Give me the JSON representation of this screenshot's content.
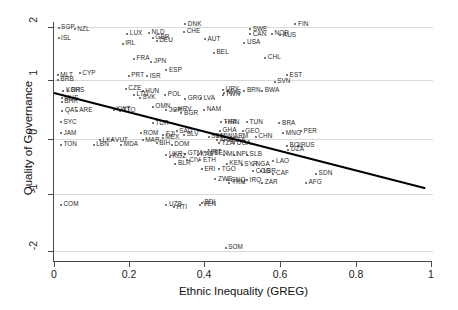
{
  "chart_data": {
    "type": "scatter",
    "title": "",
    "xlabel": "Ethnic Inequality (GREG)",
    "ylabel": "Quality of Governance",
    "xlim": [
      0,
      1
    ],
    "ylim": [
      -2.2,
      2.2
    ],
    "xticks": [
      0,
      0.2,
      0.4,
      0.6,
      0.8,
      1
    ],
    "xticklabels": [
      "0",
      "0.2",
      "0.4",
      "0.6",
      "0.8",
      "1"
    ],
    "yticks": [
      2,
      1,
      0,
      -1,
      -2
    ],
    "yticklabels": [
      "2",
      "1",
      "0",
      "-1",
      "-2"
    ],
    "grid": "horizontal",
    "legend": "none",
    "point_color": "#4d4d4d",
    "label_color": "#2b2b2b",
    "grid_color": "#d9d9d9",
    "axis_color": "#4a4a4a",
    "fit_line": {
      "type": "linear-fit",
      "color": "#000000",
      "width": 2.0,
      "x_start": 0.0,
      "y_start": 0.82,
      "x_end": 0.985,
      "y_end": -0.88,
      "slope": -1.73,
      "intercept": 0.82
    },
    "points": [
      {
        "label": "SGP",
        "x": 0.012,
        "y": 1.99
      },
      {
        "label": "NZL",
        "x": 0.055,
        "y": 1.96
      },
      {
        "label": "DNK",
        "x": 0.348,
        "y": 2.05
      },
      {
        "label": "FIN",
        "x": 0.64,
        "y": 2.05
      },
      {
        "label": "SWE",
        "x": 0.52,
        "y": 1.96
      },
      {
        "label": "ISL",
        "x": 0.012,
        "y": 1.8
      },
      {
        "label": "LUX",
        "x": 0.194,
        "y": 1.88
      },
      {
        "label": "NLD",
        "x": 0.252,
        "y": 1.9
      },
      {
        "label": "CHE",
        "x": 0.345,
        "y": 1.91
      },
      {
        "label": "CAN",
        "x": 0.52,
        "y": 1.87
      },
      {
        "label": "NOR",
        "x": 0.578,
        "y": 1.88
      },
      {
        "label": "AUS",
        "x": 0.6,
        "y": 1.85
      },
      {
        "label": "GBR",
        "x": 0.262,
        "y": 1.81
      },
      {
        "label": "DEU",
        "x": 0.272,
        "y": 1.75
      },
      {
        "label": "AUT",
        "x": 0.4,
        "y": 1.78
      },
      {
        "label": "IRL",
        "x": 0.182,
        "y": 1.7
      },
      {
        "label": "USA",
        "x": 0.505,
        "y": 1.72
      },
      {
        "label": "BEL",
        "x": 0.424,
        "y": 1.54
      },
      {
        "label": "FRA",
        "x": 0.212,
        "y": 1.43
      },
      {
        "label": "JPN",
        "x": 0.258,
        "y": 1.38
      },
      {
        "label": "CHL",
        "x": 0.56,
        "y": 1.45
      },
      {
        "label": "ESP",
        "x": 0.298,
        "y": 1.23
      },
      {
        "label": "MLT",
        "x": 0.01,
        "y": 1.14
      },
      {
        "label": "CYP",
        "x": 0.068,
        "y": 1.17
      },
      {
        "label": "PRT",
        "x": 0.198,
        "y": 1.13
      },
      {
        "label": "ISR",
        "x": 0.247,
        "y": 1.12
      },
      {
        "label": "EST",
        "x": 0.618,
        "y": 1.14
      },
      {
        "label": "BRB",
        "x": 0.01,
        "y": 1.06
      },
      {
        "label": "SVN",
        "x": 0.585,
        "y": 1.02
      },
      {
        "label": "CZE",
        "x": 0.19,
        "y": 0.9
      },
      {
        "label": "HUN",
        "x": 0.235,
        "y": 0.85
      },
      {
        "label": "POL",
        "x": 0.295,
        "y": 0.79
      },
      {
        "label": "KOR",
        "x": 0.025,
        "y": 0.86
      },
      {
        "label": "BHS",
        "x": 0.038,
        "y": 0.86
      },
      {
        "label": "LTU",
        "x": 0.212,
        "y": 0.79
      },
      {
        "label": "SVK",
        "x": 0.228,
        "y": 0.74
      },
      {
        "label": "URY",
        "x": 0.448,
        "y": 0.88
      },
      {
        "label": "MYS",
        "x": 0.452,
        "y": 0.82
      },
      {
        "label": "TWN",
        "x": 0.448,
        "y": 0.79
      },
      {
        "label": "BRN",
        "x": 0.505,
        "y": 0.86
      },
      {
        "label": "BWA",
        "x": 0.552,
        "y": 0.86
      },
      {
        "label": "MUS",
        "x": 0.02,
        "y": 0.73
      },
      {
        "label": "BHR",
        "x": 0.02,
        "y": 0.66
      },
      {
        "label": "LVA",
        "x": 0.39,
        "y": 0.73
      },
      {
        "label": "GRC",
        "x": 0.348,
        "y": 0.72
      },
      {
        "label": "OMN",
        "x": 0.262,
        "y": 0.58
      },
      {
        "label": "KWT",
        "x": 0.158,
        "y": 0.52
      },
      {
        "label": "QAT",
        "x": 0.022,
        "y": 0.5
      },
      {
        "label": "ARE",
        "x": 0.06,
        "y": 0.5
      },
      {
        "label": "TTO",
        "x": 0.175,
        "y": 0.5
      },
      {
        "label": "BGR",
        "x": 0.338,
        "y": 0.46
      },
      {
        "label": "HRV",
        "x": 0.322,
        "y": 0.52
      },
      {
        "label": "JOR",
        "x": 0.298,
        "y": 0.51
      },
      {
        "label": "NAM",
        "x": 0.398,
        "y": 0.52
      },
      {
        "label": "SYC",
        "x": 0.018,
        "y": 0.3
      },
      {
        "label": "TUR",
        "x": 0.262,
        "y": 0.28
      },
      {
        "label": "THA",
        "x": 0.443,
        "y": 0.3
      },
      {
        "label": "IRN",
        "x": 0.455,
        "y": 0.3
      },
      {
        "label": "TUN",
        "x": 0.512,
        "y": 0.3
      },
      {
        "label": "BRA",
        "x": 0.598,
        "y": 0.28
      },
      {
        "label": "JAM",
        "x": 0.018,
        "y": 0.1
      },
      {
        "label": "ROM",
        "x": 0.23,
        "y": 0.1
      },
      {
        "label": "SAU",
        "x": 0.325,
        "y": 0.14
      },
      {
        "label": "GHA",
        "x": 0.44,
        "y": 0.15
      },
      {
        "label": "GEO",
        "x": 0.5,
        "y": 0.14
      },
      {
        "label": "CHN",
        "x": 0.535,
        "y": 0.04
      },
      {
        "label": "MNG",
        "x": 0.608,
        "y": 0.1
      },
      {
        "label": "PER",
        "x": 0.655,
        "y": 0.14
      },
      {
        "label": "MEX",
        "x": 0.288,
        "y": 0.02
      },
      {
        "label": "SEN",
        "x": 0.41,
        "y": 0.04
      },
      {
        "label": "MWI",
        "x": 0.435,
        "y": 0.04
      },
      {
        "label": "ARM",
        "x": 0.47,
        "y": 0.04
      },
      {
        "label": "TON",
        "x": 0.018,
        "y": -0.1
      },
      {
        "label": "LBN",
        "x": 0.105,
        "y": -0.1
      },
      {
        "label": "MDA",
        "x": 0.178,
        "y": -0.1
      },
      {
        "label": "LKA",
        "x": 0.122,
        "y": -0.02
      },
      {
        "label": "VUT",
        "x": 0.155,
        "y": -0.02
      },
      {
        "label": "MAR",
        "x": 0.235,
        "y": -0.02
      },
      {
        "label": "FJI",
        "x": 0.29,
        "y": 0.08
      },
      {
        "label": "SLV",
        "x": 0.345,
        "y": 0.08
      },
      {
        "label": "BIH",
        "x": 0.272,
        "y": -0.08
      },
      {
        "label": "DOM",
        "x": 0.312,
        "y": -0.1
      },
      {
        "label": "ARG",
        "x": 0.432,
        "y": -0.02
      },
      {
        "label": "BFA",
        "x": 0.468,
        "y": -0.02
      },
      {
        "label": "TZA",
        "x": 0.438,
        "y": -0.08
      },
      {
        "label": "UGA",
        "x": 0.478,
        "y": -0.08
      },
      {
        "label": "BOL",
        "x": 0.618,
        "y": -0.12
      },
      {
        "label": "RUS",
        "x": 0.648,
        "y": -0.12
      },
      {
        "label": "DZA",
        "x": 0.622,
        "y": -0.19
      },
      {
        "label": "UKR",
        "x": 0.298,
        "y": -0.28
      },
      {
        "label": "KGZ",
        "x": 0.308,
        "y": -0.32
      },
      {
        "label": "GTM",
        "x": 0.348,
        "y": -0.26
      },
      {
        "label": "KAZ",
        "x": 0.382,
        "y": -0.28
      },
      {
        "label": "MRT",
        "x": 0.4,
        "y": -0.24
      },
      {
        "label": "BEN",
        "x": 0.418,
        "y": -0.26
      },
      {
        "label": "MLI",
        "x": 0.452,
        "y": -0.28
      },
      {
        "label": "NPL",
        "x": 0.478,
        "y": -0.28
      },
      {
        "label": "SLB",
        "x": 0.512,
        "y": -0.28
      },
      {
        "label": "LAO",
        "x": 0.582,
        "y": -0.4
      },
      {
        "label": "BLR",
        "x": 0.322,
        "y": -0.44
      },
      {
        "label": "CIV",
        "x": 0.352,
        "y": -0.38
      },
      {
        "label": "ETH",
        "x": 0.388,
        "y": -0.38
      },
      {
        "label": "KEN",
        "x": 0.458,
        "y": -0.44
      },
      {
        "label": "SYR",
        "x": 0.498,
        "y": -0.46
      },
      {
        "label": "NGA",
        "x": 0.528,
        "y": -0.46
      },
      {
        "label": "ERI",
        "x": 0.392,
        "y": -0.54
      },
      {
        "label": "TGO",
        "x": 0.438,
        "y": -0.54
      },
      {
        "label": "SDN",
        "x": 0.695,
        "y": -0.62
      },
      {
        "label": "CAF",
        "x": 0.582,
        "y": -0.62
      },
      {
        "label": "LBR",
        "x": 0.548,
        "y": -0.58
      },
      {
        "label": "COG",
        "x": 0.528,
        "y": -0.58
      },
      {
        "label": "UZB",
        "x": 0.298,
        "y": -1.18
      },
      {
        "label": "HTI",
        "x": 0.318,
        "y": -1.22
      },
      {
        "label": "VEN",
        "x": 0.388,
        "y": -1.18
      },
      {
        "label": "BDI",
        "x": 0.392,
        "y": -1.14
      },
      {
        "label": "COM",
        "x": 0.018,
        "y": -1.18
      },
      {
        "label": "ZWE",
        "x": 0.428,
        "y": -0.72
      },
      {
        "label": "GNQ",
        "x": 0.462,
        "y": -0.74
      },
      {
        "label": "TKM",
        "x": 0.465,
        "y": -0.78
      },
      {
        "label": "IRQ",
        "x": 0.512,
        "y": -0.74
      },
      {
        "label": "ZAR",
        "x": 0.552,
        "y": -0.78
      },
      {
        "label": "AFG",
        "x": 0.668,
        "y": -0.78
      },
      {
        "label": "SOM",
        "x": 0.455,
        "y": -1.94
      }
    ]
  },
  "axis": {
    "x_title": "Ethnic Inequality (GREG)",
    "y_title": "Quality of Governance",
    "x_ticklabels": [
      "0",
      "0.2",
      "0.4",
      "0.6",
      "0.8",
      "1"
    ],
    "y_ticklabels": [
      "2",
      "1",
      "0",
      "-1",
      "-2"
    ]
  }
}
